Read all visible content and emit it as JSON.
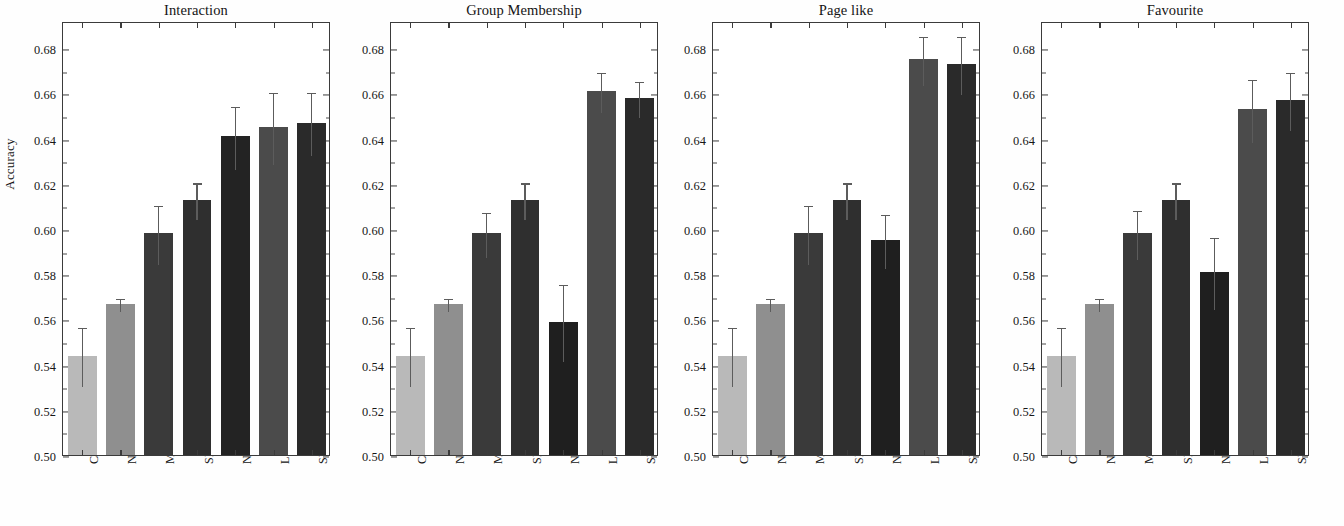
{
  "figure": {
    "ylabel": "Accuracy",
    "y_ticks": [
      "0.50",
      "0.52",
      "0.54",
      "0.56",
      "0.58",
      "0.60",
      "0.62",
      "0.64",
      "0.66",
      "0.68"
    ]
  },
  "chart_data": [
    {
      "type": "bar",
      "title": "Interaction",
      "xlabel": "",
      "ylabel": "Accuracy",
      "ylim": [
        0.5,
        0.692
      ],
      "ytick_values": [
        0.5,
        0.52,
        0.54,
        0.56,
        0.58,
        0.6,
        0.62,
        0.64,
        0.66,
        0.68
      ],
      "grid": false,
      "legend": "none",
      "categories": [
        "Const",
        "NN",
        "MF",
        "SMB",
        "NB-ISAF",
        "LR-ISAF",
        "SVM-ISAF"
      ],
      "values": [
        0.544,
        0.567,
        0.598,
        0.613,
        0.641,
        0.645,
        0.647
      ],
      "errors": [
        0.013,
        0.003,
        0.013,
        0.008,
        0.014,
        0.016,
        0.014
      ],
      "bar_colors": [
        "#b9b9b9",
        "#8f8f8f",
        "#3a3a3a",
        "#2f2f2f",
        "#232323",
        "#4b4b4b",
        "#2a2a2a"
      ]
    },
    {
      "type": "bar",
      "title": "Group Membership",
      "xlabel": "",
      "ylabel": "Accuracy",
      "ylim": [
        0.5,
        0.692
      ],
      "ytick_values": [
        0.5,
        0.52,
        0.54,
        0.56,
        0.58,
        0.6,
        0.62,
        0.64,
        0.66,
        0.68
      ],
      "grid": false,
      "legend": "none",
      "categories": [
        "Const",
        "NN",
        "MF",
        "SMB",
        "NB-ASAF",
        "LR-ASAF",
        "SVM-ASAF"
      ],
      "values": [
        0.544,
        0.567,
        0.598,
        0.613,
        0.559,
        0.661,
        0.658
      ],
      "errors": [
        0.013,
        0.003,
        0.01,
        0.008,
        0.017,
        0.009,
        0.008
      ],
      "bar_colors": [
        "#b9b9b9",
        "#8f8f8f",
        "#3a3a3a",
        "#2f2f2f",
        "#1f1f1f",
        "#4b4b4b",
        "#2a2a2a"
      ]
    },
    {
      "type": "bar",
      "title": "Page like",
      "xlabel": "",
      "ylabel": "Accuracy",
      "ylim": [
        0.5,
        0.692
      ],
      "ytick_values": [
        0.5,
        0.52,
        0.54,
        0.56,
        0.58,
        0.6,
        0.62,
        0.64,
        0.66,
        0.68
      ],
      "grid": false,
      "legend": "none",
      "categories": [
        "Const",
        "NN",
        "MF",
        "SMB",
        "NB-ASAF",
        "LR-ASAF",
        "SVM-ASAF"
      ],
      "values": [
        0.544,
        0.567,
        0.598,
        0.613,
        0.595,
        0.675,
        0.673
      ],
      "errors": [
        0.013,
        0.003,
        0.013,
        0.008,
        0.012,
        0.011,
        0.013
      ],
      "bar_colors": [
        "#b9b9b9",
        "#8f8f8f",
        "#3a3a3a",
        "#2f2f2f",
        "#1f1f1f",
        "#4b4b4b",
        "#2a2a2a"
      ]
    },
    {
      "type": "bar",
      "title": "Favourite",
      "xlabel": "",
      "ylabel": "Accuracy",
      "ylim": [
        0.5,
        0.692
      ],
      "ytick_values": [
        0.5,
        0.52,
        0.54,
        0.56,
        0.58,
        0.6,
        0.62,
        0.64,
        0.66,
        0.68
      ],
      "grid": false,
      "legend": "none",
      "categories": [
        "Const",
        "NN",
        "MF",
        "SMB",
        "NB-ASAF",
        "LR-ASAF",
        "SVM-ASAF"
      ],
      "values": [
        0.544,
        0.567,
        0.598,
        0.613,
        0.581,
        0.653,
        0.657
      ],
      "errors": [
        0.013,
        0.003,
        0.011,
        0.008,
        0.016,
        0.014,
        0.013
      ],
      "bar_colors": [
        "#b9b9b9",
        "#8f8f8f",
        "#3a3a3a",
        "#2f2f2f",
        "#1f1f1f",
        "#4b4b4b",
        "#2a2a2a"
      ]
    }
  ]
}
